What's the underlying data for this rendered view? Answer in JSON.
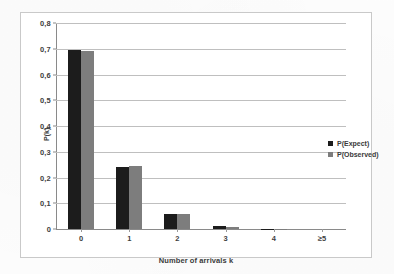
{
  "chart_data": {
    "type": "bar",
    "title": "",
    "subtitle": "",
    "xlabel": "Number of arrivals k",
    "ylabel": "P(k)",
    "categories": [
      "0",
      "1",
      "2",
      "3",
      "4",
      "≥5"
    ],
    "series": [
      {
        "name": "P(Expect)",
        "color": "#1c1c1c",
        "values": [
          0.695,
          0.242,
          0.057,
          0.01,
          0.002,
          0.0
        ]
      },
      {
        "name": "P(Observed)",
        "color": "#7d7d7d",
        "values": [
          0.692,
          0.243,
          0.057,
          0.009,
          0.001,
          0.0
        ]
      }
    ],
    "ylim": [
      0,
      0.8
    ],
    "ytick_values": [
      0,
      0.1,
      0.2,
      0.3,
      0.4,
      0.5,
      0.6,
      0.7,
      0.8
    ],
    "ytick_labels": [
      "0",
      "0,1",
      "0,2",
      "0,3",
      "0,4",
      "0,5",
      "0,6",
      "0,7",
      "0,8"
    ],
    "grid": true,
    "grid_axis": "y",
    "legend_position": "right",
    "decimal_separator": ",",
    "colors": {
      "expect": "#1c1c1c",
      "observed": "#7d7d7d",
      "gridline": "#bfbfbf",
      "axis": "#8a8a8a",
      "frame": "#c9c9c9",
      "background": "#ffffff",
      "text": "#404040"
    }
  },
  "legend": {
    "items": [
      {
        "label": "P(Expect)"
      },
      {
        "label": "P(Observed)"
      }
    ]
  }
}
